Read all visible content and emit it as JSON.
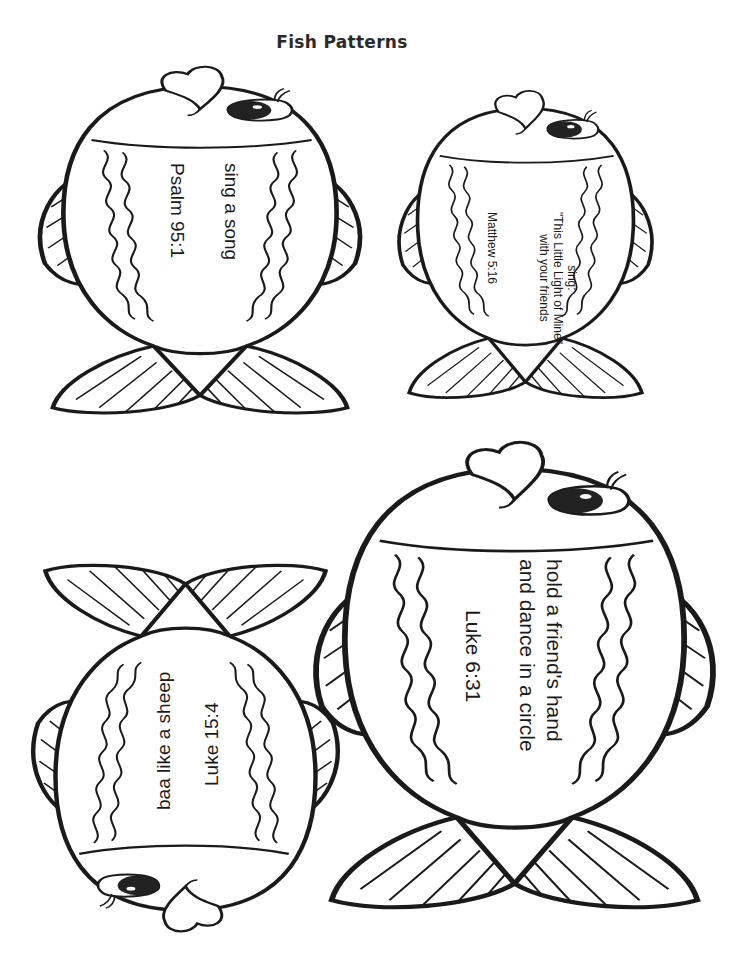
{
  "page": {
    "title": "Fish Patterns"
  },
  "fish": [
    {
      "id": "fish-1",
      "position": "top-left",
      "orientation": "head-up",
      "activity": [
        "sing a song"
      ],
      "reference": "Psalm 95:1"
    },
    {
      "id": "fish-2",
      "position": "top-right",
      "orientation": "head-up",
      "activity": [
        "sing:",
        "\"This Little Light of Mine\"",
        "with your friends"
      ],
      "reference": "Matthew 5:16"
    },
    {
      "id": "fish-3",
      "position": "bottom-right",
      "orientation": "head-up",
      "activity": [
        "hold a friend's hand",
        "and dance in a circle"
      ],
      "reference": "Luke 6:31"
    },
    {
      "id": "fish-4",
      "position": "bottom-left",
      "orientation": "head-down",
      "activity": [
        "baa like a sheep"
      ],
      "reference": "Luke 15:4"
    }
  ],
  "colors": {
    "ink": "#1a1a1a",
    "paper": "#ffffff",
    "eye": "#222222"
  }
}
